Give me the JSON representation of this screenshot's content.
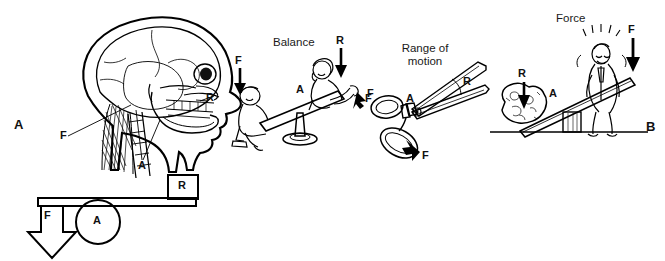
{
  "figure": {
    "background": "#ffffff",
    "ink_color": "#000000",
    "panels": [
      {
        "id": "panel-a",
        "letter": "A",
        "caption_position": "left-middle",
        "content": "Lateral view of human skull and cervical spine with posterior neck musculature, plus an equivalent schematic first-class lever",
        "markers": [
          {
            "label": "F",
            "meaning": "force",
            "target": "posterior neck muscles"
          },
          {
            "label": "A",
            "meaning": "axis",
            "target": "atlanto-occipital joint"
          },
          {
            "label": "R",
            "meaning": "resistance",
            "target": "weight of the face and anterior skull"
          }
        ],
        "schematic": {
          "type": "first-class lever",
          "force_label": "F",
          "axis_label": "A",
          "resistance_label": "R"
        }
      },
      {
        "id": "panel-b",
        "letter": "B",
        "caption_position": "right-middle",
        "content": "Three everyday examples of first-class levers",
        "examples": [
          {
            "id": "balance",
            "heading": "Balance",
            "illustration": "Two children on a seesaw, a boy seated at the left end and a girl at the right end, pivoting on a central pedestal",
            "markers": [
              {
                "label": "F",
                "meaning": "force",
                "target": "boy pushing down on left end"
              },
              {
                "label": "A",
                "meaning": "axis",
                "target": "seesaw pivot"
              },
              {
                "label": "R",
                "meaning": "resistance",
                "target": "girl's weight on right end"
              },
              {
                "label": "F",
                "meaning": "force",
                "target": "right-side push near pivot"
              }
            ]
          },
          {
            "id": "range-of-motion",
            "heading": "Range of\nmotion",
            "heading_lines": [
              "Range of",
              "motion"
            ],
            "illustration": "An open pair of scissors seen from the side, blades spread apart",
            "markers": [
              {
                "label": "F",
                "meaning": "force",
                "target": "upper finger loop"
              },
              {
                "label": "A",
                "meaning": "axis",
                "target": "scissor pivot screw"
              },
              {
                "label": "R",
                "meaning": "resistance / range",
                "target": "angle swept by the blades"
              },
              {
                "label": "F",
                "meaning": "force",
                "target": "lower finger loop, arrow pointing up-left"
              }
            ]
          },
          {
            "id": "force",
            "heading": "Force",
            "illustration": "A man sitting on the raised end of a plank that pries a large boulder upward over a block fulcrum resting on the ground",
            "markers": [
              {
                "label": "R",
                "meaning": "resistance",
                "target": "boulder"
              },
              {
                "label": "A",
                "meaning": "axis",
                "target": "fulcrum block"
              },
              {
                "label": "F",
                "meaning": "force",
                "target": "man's body weight on plank end"
              }
            ]
          }
        ]
      }
    ]
  }
}
